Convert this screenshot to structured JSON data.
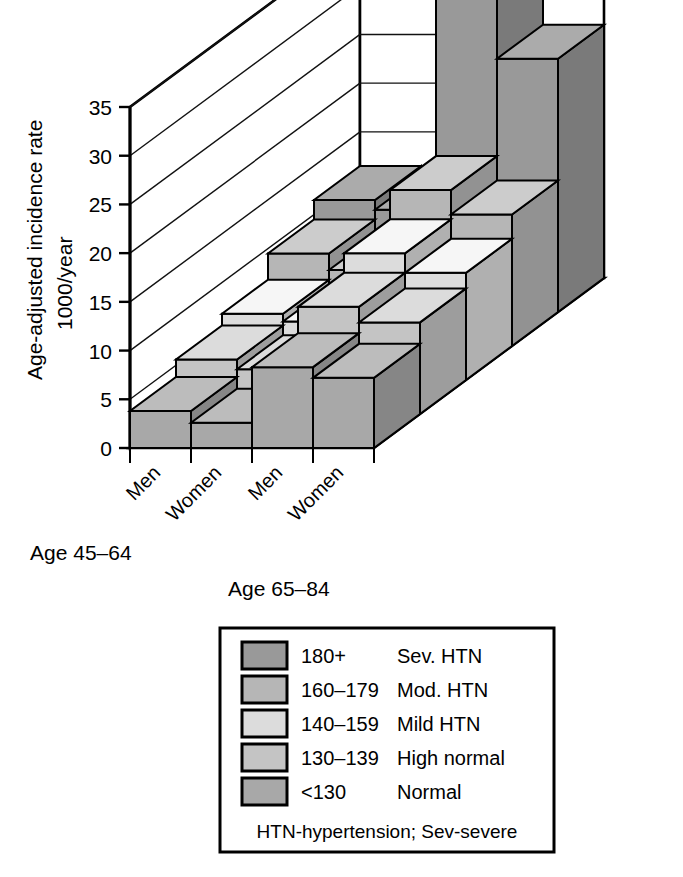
{
  "chart_data": {
    "type": "bar",
    "title": "",
    "subtitle": "",
    "projection": "3d-isometric",
    "ylabel_line1": "Age-adjusted incidence rate",
    "ylabel_line2": "1000/year",
    "xlabel": "",
    "zlabel": "",
    "ylim": [
      0,
      37
    ],
    "yticks": [
      "0",
      "5",
      "10",
      "15",
      "20",
      "25",
      "30",
      "35"
    ],
    "ytick_values": [
      0,
      5,
      10,
      15,
      20,
      25,
      30,
      35
    ],
    "grid": true,
    "legend_position": "below-chart",
    "categories": [
      "Men",
      "Women",
      "Men",
      "Women"
    ],
    "category_groups": [
      {
        "label": "Age 45–64",
        "columns": [
          "Men",
          "Women"
        ]
      },
      {
        "label": "Age 65–84",
        "columns": [
          "Men",
          "Women"
        ]
      }
    ],
    "series": [
      {
        "name": "<130",
        "label": "Normal",
        "range": "<130",
        "color": "#a8a8a8",
        "values": [
          3.8,
          2.6,
          8.3,
          7.2
        ]
      },
      {
        "name": "130-139",
        "label": "High normal",
        "range": "130–139",
        "color": "#c4c4c4",
        "values": [
          5.6,
          4.6,
          11.0,
          9.4
        ]
      },
      {
        "name": "140-159",
        "label": "Mild HTN",
        "range": "140–159",
        "color": "#dcdcdc",
        "values": [
          6.8,
          6.0,
          13.0,
          11.0
        ]
      },
      {
        "name": "160-179",
        "label": "Mod. HTN",
        "range": "160–179",
        "color": "#b6b6b6",
        "values": [
          9.5,
          7.8,
          16.0,
          13.5
        ]
      },
      {
        "name": "180+",
        "label": "Sev. HTN",
        "range": "180+",
        "color": "#999999",
        "values": [
          11.5,
          10.5,
          36.5,
          26.0
        ]
      }
    ]
  },
  "axis": {
    "y_title_line1": "Age-adjusted incidence rate",
    "y_title_line2": "1000/year",
    "ticks": [
      "35",
      "30",
      "25",
      "20",
      "15",
      "10",
      "5",
      "0"
    ],
    "column_labels": [
      "Men",
      "Women",
      "Men",
      "Women"
    ],
    "group_label_left": "Age 45–64",
    "group_label_right": "Age 65–84"
  },
  "legend": {
    "items": [
      {
        "swatch_color": "#999999",
        "range": "180+",
        "label": "Sev. HTN"
      },
      {
        "swatch_color": "#b6b6b6",
        "range": "160–179",
        "label": "Mod. HTN"
      },
      {
        "swatch_color": "#dcdcdc",
        "range": "140–159",
        "label": "Mild HTN"
      },
      {
        "swatch_color": "#c4c4c4",
        "range": "130–139",
        "label": "High normal"
      },
      {
        "swatch_color": "#a8a8a8",
        "range": "<130",
        "label": "Normal"
      }
    ],
    "footnote": "HTN-hypertension; Sev-severe"
  },
  "colors": {
    "background": "#ffffff",
    "outline": "#000000",
    "grid": "#1a1a1a"
  }
}
